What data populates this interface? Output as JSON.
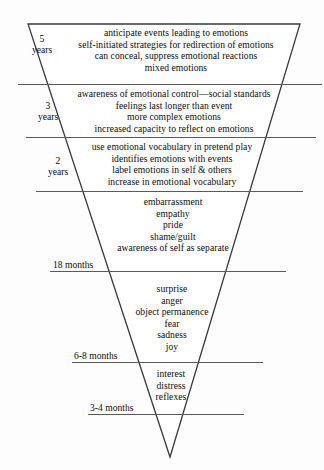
{
  "diagram": {
    "shape": {
      "name": "inverted-triangle",
      "stroke_color": "#3a3a3a",
      "fill_color": "#ffffff",
      "top_left_x": 28,
      "top_right_x": 300,
      "top_y": 24,
      "apex_x": 170,
      "apex_y": 457
    },
    "background_color": "#fdfdfd",
    "text_color": "#0d0d0d",
    "divider_color": "#5a5a5a"
  },
  "tiers": [
    {
      "id": "tier-5-years",
      "age_label_lines": [
        "5",
        "years"
      ],
      "age_label_style": "stacked",
      "items": [
        "anticipate events leading to emotions",
        "self-initiated strategies for redirection of emotions",
        "can conceal, suppress emotional reactions",
        "mixed emotions"
      ]
    },
    {
      "id": "tier-3-years",
      "age_label_lines": [
        "3",
        "years"
      ],
      "age_label_style": "stacked",
      "items": [
        "awareness of emotional control—social standards",
        "feelings last longer than event",
        "more complex emotions",
        "increased capacity to reflect on emotions"
      ]
    },
    {
      "id": "tier-2-years",
      "age_label_lines": [
        "2",
        "years"
      ],
      "age_label_style": "stacked",
      "items": [
        "use emotional vocabulary in pretend play",
        "identifies emotions with events",
        "label emotions in self & others",
        "increase in emotional vocabulary"
      ]
    },
    {
      "id": "tier-18-months",
      "age_label_lines": [
        "18 months"
      ],
      "age_label_style": "inline",
      "items": [
        "embarrassment",
        "empathy",
        "pride",
        "shame/guilt",
        "awareness of self as separate"
      ]
    },
    {
      "id": "tier-6-8-months",
      "age_label_lines": [
        "6-8 months"
      ],
      "age_label_style": "inline",
      "items": [
        "surprise",
        "anger",
        "object permanence",
        "fear",
        "sadness",
        "joy"
      ]
    },
    {
      "id": "tier-3-4-months",
      "age_label_lines": [
        "3-4 months"
      ],
      "age_label_style": "inline",
      "items": [
        "interest",
        "distress",
        "reflexes"
      ]
    }
  ]
}
